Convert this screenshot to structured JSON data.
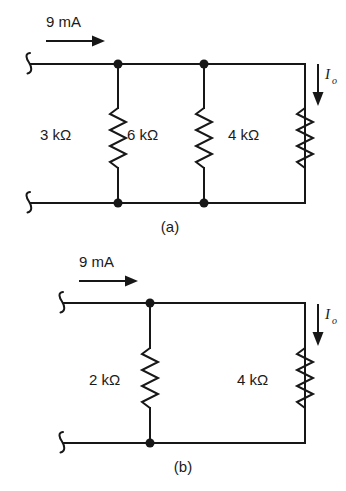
{
  "figure": {
    "background_color": "#ffffff",
    "line_color": "#171717"
  },
  "circuits": [
    {
      "id": "circuit-a",
      "caption": "(a)",
      "source_label": "9 mA",
      "output_current_label": "I",
      "output_current_subscript": "o",
      "output_current_direction": "down",
      "source_arrow_direction": "right",
      "resistors": [
        {
          "label": "3 kΩ",
          "value": 3,
          "unit": "kΩ"
        },
        {
          "label": "6 kΩ",
          "value": 6,
          "unit": "kΩ"
        },
        {
          "label": "4 kΩ",
          "value": 4,
          "unit": "kΩ"
        }
      ],
      "node_count": 4,
      "terminals": [
        "top-left",
        "bottom-left"
      ]
    },
    {
      "id": "circuit-b",
      "caption": "(b)",
      "source_label": "9 mA",
      "output_current_label": "I",
      "output_current_subscript": "o",
      "output_current_direction": "down",
      "source_arrow_direction": "right",
      "resistors": [
        {
          "label": "2 kΩ",
          "value": 2,
          "unit": "kΩ"
        },
        {
          "label": "4 kΩ",
          "value": 4,
          "unit": "kΩ"
        }
      ],
      "node_count": 2,
      "terminals": [
        "top-left",
        "bottom-left"
      ]
    }
  ]
}
